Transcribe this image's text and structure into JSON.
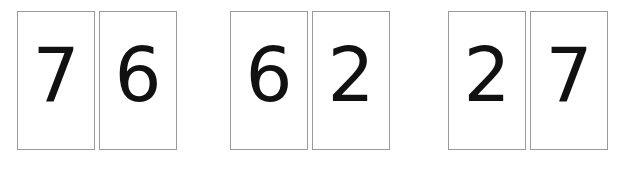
{
  "scene": {
    "width": 631,
    "height": 169,
    "background_color": "#ffffff",
    "description": "Six white number cards arranged in three pairs"
  },
  "card_style": {
    "background_color": "#ffffff",
    "border_color": "#9a9a9a",
    "digit_color": "#111111"
  },
  "groups": [
    {
      "name": "pair-1",
      "cards": [
        {
          "digit": "7"
        },
        {
          "digit": "6"
        }
      ]
    },
    {
      "name": "pair-2",
      "cards": [
        {
          "digit": "6"
        },
        {
          "digit": "2"
        }
      ]
    },
    {
      "name": "pair-3",
      "cards": [
        {
          "digit": "2"
        },
        {
          "digit": "7"
        }
      ]
    }
  ]
}
